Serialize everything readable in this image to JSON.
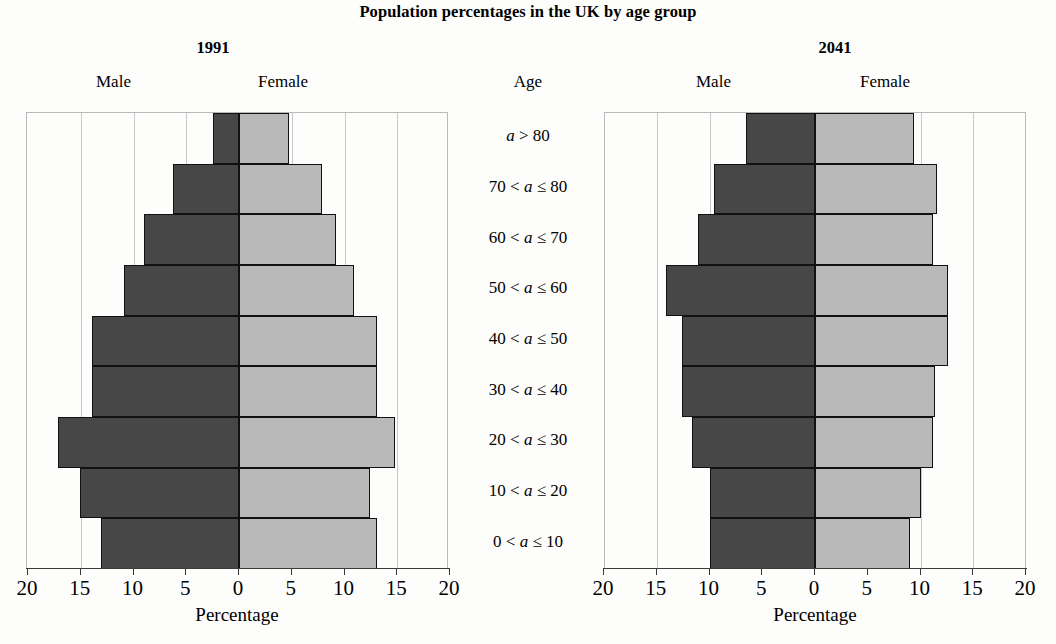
{
  "title": "Population percentages in the UK by age group",
  "age_column": {
    "header": "Age",
    "labels": [
      "a > 80",
      "70 < a ≤ 80",
      "60 < a ≤ 70",
      "50 < a ≤ 60",
      "40 < a ≤ 50",
      "30 < a ≤ 40",
      "20 < a ≤ 30",
      "10 < a ≤ 20",
      "0 < a ≤ 10"
    ]
  },
  "panels": [
    {
      "name": "1991",
      "male_label": "Male",
      "female_label": "Female",
      "axis_caption": "Percentage",
      "tick_labels": [
        "20",
        "15",
        "10",
        "5",
        "0",
        "5",
        "10",
        "15",
        "20"
      ]
    },
    {
      "name": "2041",
      "male_label": "Male",
      "female_label": "Female",
      "axis_caption": "Percentage",
      "tick_labels": [
        "20",
        "15",
        "10",
        "5",
        "0",
        "5",
        "10",
        "15",
        "20"
      ]
    }
  ],
  "colors": {
    "male": "#474747",
    "female": "#b9b9b9",
    "bar_outline": "#111111",
    "grid": "#c9c9c9",
    "axis": "#3a3a3a"
  },
  "chart_data": {
    "type": "bar",
    "chart_style": "population-pyramid",
    "title": "Population percentages in the UK by age group",
    "xlabel": "Percentage",
    "ylabel": "Age",
    "xlim": [
      -20,
      20
    ],
    "xticks": [
      -20,
      -15,
      -10,
      -5,
      0,
      5,
      10,
      15,
      20
    ],
    "xticklabels": [
      "20",
      "15",
      "10",
      "5",
      "0",
      "5",
      "10",
      "15",
      "20"
    ],
    "grid": true,
    "legend": "none",
    "categories": [
      "a > 80",
      "70 < a ≤ 80",
      "60 < a ≤ 70",
      "50 < a ≤ 60",
      "40 < a ≤ 50",
      "30 < a ≤ 40",
      "20 < a ≤ 30",
      "10 < a ≤ 20",
      "0 < a ≤ 10"
    ],
    "panels": [
      {
        "name": "1991",
        "series": [
          {
            "name": "Male",
            "values": [
              2.5,
              6.3,
              9.0,
              10.9,
              13.9,
              13.9,
              17.2,
              15.1,
              13.1
            ]
          },
          {
            "name": "Female",
            "values": [
              4.7,
              7.9,
              9.2,
              10.9,
              13.1,
              13.1,
              14.8,
              12.4,
              13.1
            ]
          }
        ]
      },
      {
        "name": "2041",
        "series": [
          {
            "name": "Male",
            "values": [
              6.5,
              9.6,
              11.1,
              14.1,
              12.6,
              12.6,
              11.7,
              10.0,
              10.0
            ]
          },
          {
            "name": "Female",
            "values": [
              9.4,
              11.6,
              11.2,
              12.6,
              12.6,
              11.4,
              11.2,
              10.0,
              9.0
            ]
          }
        ]
      }
    ]
  }
}
